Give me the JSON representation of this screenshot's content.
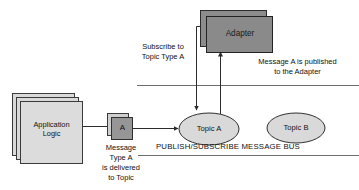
{
  "diagram": {
    "type": "publish-subscribe-message-bus",
    "nodes": {
      "application_logic": {
        "label": "Application\nLogic",
        "shape": "stacked-rectangle",
        "fill": "#d9d9d9",
        "stack_count": 3
      },
      "message_a": {
        "label": "A",
        "shape": "stacked-rectangle",
        "fill": "#969696",
        "stack_count": 2
      },
      "adapter": {
        "label": "Adapter",
        "shape": "stacked-rectangle",
        "fill": "#8c8c8c",
        "stack_count": 2
      },
      "topic_a": {
        "label": "Topic A",
        "shape": "ellipse",
        "fill": "#d9d9d9"
      },
      "topic_b": {
        "label": "Topic B",
        "shape": "ellipse",
        "fill": "#d9d9d9"
      }
    },
    "annotations": {
      "subscribe": "Subscribe to\nTopic Type A",
      "published": "Message A is published\nto the Adapter",
      "delivered": "Message\nType A\nis delivered\nto Topic"
    },
    "bus": {
      "title": "PUBLISH/SUBSCRIBE MESSAGE BUS",
      "line_color": "#6e6e6e"
    },
    "edges": {
      "app_to_message": "Application Logic to Message A",
      "message_to_topic": "Message A to Topic A",
      "adapter_subscribe": "Adapter subscribes to Topic A",
      "topic_publish": "Topic A publishes to Adapter"
    },
    "colors": {
      "stroke": "#333333",
      "light_fill": "#d9d9d9",
      "dark_fill": "#8c8c8c",
      "text": "#111111"
    }
  }
}
